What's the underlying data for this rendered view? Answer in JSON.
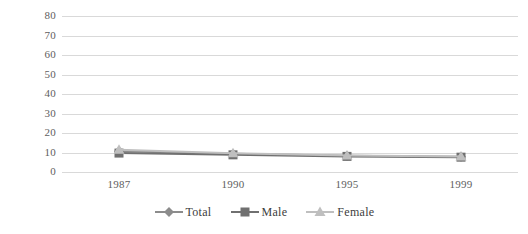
{
  "chart_data": {
    "type": "line",
    "title": "",
    "subtitle": "",
    "xlabel": "",
    "ylabel": "",
    "categories": [
      "1987",
      "1990",
      "1995",
      "1999"
    ],
    "ylim": [
      0,
      80
    ],
    "ytick_step": 10,
    "yticks": [
      "80",
      "70",
      "60",
      "50",
      "40",
      "30",
      "20",
      "10",
      "0"
    ],
    "grid": true,
    "legend_position": "bottom",
    "series": [
      {
        "name": "Total",
        "marker": "diamond",
        "color": "#8c8c8c",
        "values": [
          10.6,
          9.3,
          8.3,
          7.8
        ]
      },
      {
        "name": "Male",
        "marker": "square",
        "color": "#707070",
        "values": [
          9.7,
          8.8,
          8.0,
          7.6
        ]
      },
      {
        "name": "Female",
        "marker": "triangle",
        "color": "#bfbfbf",
        "values": [
          11.4,
          9.6,
          8.5,
          8.0
        ]
      }
    ]
  },
  "legend": {
    "items": [
      {
        "label": "Total"
      },
      {
        "label": "Male"
      },
      {
        "label": "Female"
      }
    ]
  },
  "colors": {
    "gridline": "#d9d9d9",
    "axis_text": "#5e5e5e",
    "legend_text": "#3d3d3d",
    "background": "#ffffff"
  }
}
